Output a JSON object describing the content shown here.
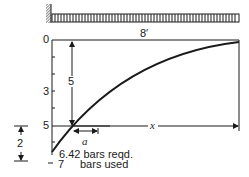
{
  "diagram": {
    "type": "cantilever bar cutoff diagram",
    "beam": {
      "support": "fixed wall (left)",
      "load": "uniformly distributed load"
    },
    "span_label": "8′",
    "axis_ticks": [
      "0",
      "3",
      "5",
      "7"
    ],
    "dimension_labels": {
      "vertical_to_cutoff": "5",
      "offset": "a",
      "length": "x",
      "bottom_gap": "2"
    },
    "annotations": {
      "required": "6.42 bars reqd.",
      "used_value": "7",
      "used_text": "bars used"
    },
    "colors": {
      "ink": "#1a1a1a",
      "background": "#ffffff"
    }
  }
}
